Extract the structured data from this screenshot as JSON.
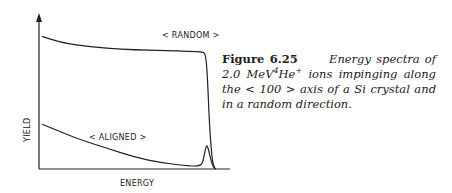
{
  "figure": {
    "number_label": "Figure 6.25",
    "caption_parts": {
      "lead": "Energy spectra of 2.0 MeV",
      "iso_mass": "4",
      "element": "He",
      "charge": "+",
      "rest": " ions impinging along the < 100 > axis of a Si crystal and in a random direction."
    }
  },
  "chart_data": {
    "type": "line",
    "title": "",
    "xlabel": "ENERGY",
    "ylabel": "YIELD",
    "xlim": [
      0,
      1
    ],
    "ylim": [
      0,
      1
    ],
    "grid": false,
    "legend": "none",
    "annotations": [
      {
        "text": "< RANDOM >",
        "series": "random"
      },
      {
        "text": "< ALIGNED >",
        "series": "aligned"
      }
    ],
    "series": [
      {
        "name": "random",
        "label": "< RANDOM >",
        "x": [
          0.0,
          0.1,
          0.2,
          0.35,
          0.5,
          0.65,
          0.8,
          0.87,
          0.885,
          0.895,
          0.905,
          0.92,
          0.935
        ],
        "y": [
          0.89,
          0.85,
          0.83,
          0.81,
          0.8,
          0.795,
          0.79,
          0.785,
          0.77,
          0.6,
          0.3,
          0.05,
          0.0
        ]
      },
      {
        "name": "aligned",
        "label": "< ALIGNED >",
        "x": [
          0.0,
          0.1,
          0.2,
          0.35,
          0.5,
          0.65,
          0.8,
          0.85,
          0.87,
          0.885,
          0.895,
          0.92,
          0.94
        ],
        "y": [
          0.3,
          0.25,
          0.2,
          0.14,
          0.08,
          0.04,
          0.02,
          0.02,
          0.04,
          0.15,
          0.16,
          0.02,
          0.0
        ]
      }
    ]
  }
}
